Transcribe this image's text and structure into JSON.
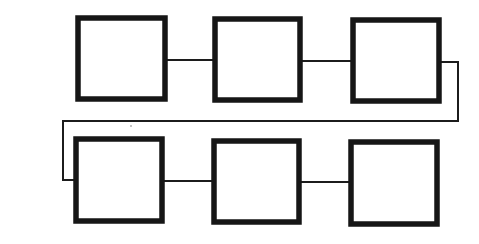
{
  "diagram": {
    "type": "serpentine-chain",
    "colors": {
      "stroke": "#161616",
      "background": "#ffffff"
    },
    "boxes": [
      {
        "id": "box-1",
        "row": 1,
        "col": 1,
        "label": "",
        "x": 78,
        "y": 18,
        "w": 87,
        "h": 81
      },
      {
        "id": "box-2",
        "row": 1,
        "col": 2,
        "label": "",
        "x": 215,
        "y": 19,
        "w": 85,
        "h": 81
      },
      {
        "id": "box-3",
        "row": 1,
        "col": 3,
        "label": "",
        "x": 353,
        "y": 20,
        "w": 86,
        "h": 81
      },
      {
        "id": "box-4",
        "row": 2,
        "col": 1,
        "label": "",
        "x": 76,
        "y": 139,
        "w": 86,
        "h": 82
      },
      {
        "id": "box-5",
        "row": 2,
        "col": 2,
        "label": "",
        "x": 214,
        "y": 141,
        "w": 85,
        "h": 81
      },
      {
        "id": "box-6",
        "row": 2,
        "col": 3,
        "label": "",
        "x": 351,
        "y": 142,
        "w": 86,
        "h": 82
      }
    ],
    "connectors": [
      {
        "id": "edge-1-2",
        "from": "box-1",
        "to": "box-2",
        "points": "167,60 213,60"
      },
      {
        "id": "edge-2-3",
        "from": "box-2",
        "to": "box-3",
        "points": "302,61 351,61"
      },
      {
        "id": "edge-3-4",
        "from": "box-3",
        "to": "box-4",
        "points": "441,62 458,62 458,121 63,121 63,180 74,180"
      },
      {
        "id": "edge-4-5",
        "from": "box-4",
        "to": "box-5",
        "points": "164,181 212,181"
      },
      {
        "id": "edge-5-6",
        "from": "box-5",
        "to": "box-6",
        "points": "301,182 349,182"
      }
    ]
  }
}
